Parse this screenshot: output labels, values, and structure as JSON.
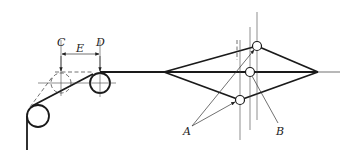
{
  "figure": {
    "labels": {
      "C": "C",
      "D": "D",
      "E": "E",
      "A": "A",
      "B": "B"
    },
    "colors": {
      "stroke": "#1a1a1a",
      "background": "#ffffff"
    }
  }
}
